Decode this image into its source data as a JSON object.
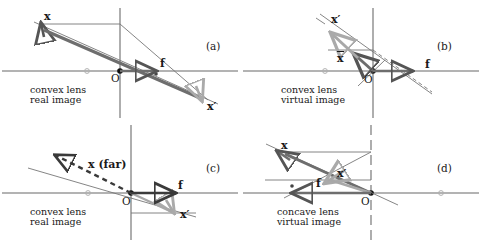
{
  "figure": {
    "panel_count": 4,
    "colors": {
      "object_vector": "#555555",
      "image_vector": "#a8a8a8",
      "axis": "#9a9a9a",
      "lens_plane": "#9a9a9a",
      "ray": "#4a4a4a",
      "text": "#1a1a1a",
      "focal_point": "#111111"
    }
  },
  "panels": [
    {
      "tag": "(a)",
      "caption_line1": "convex lens",
      "caption_line2": "real image",
      "origin_label": "O",
      "object_label": "x",
      "image_label": "x′",
      "focal_label": "f",
      "object_side": "left",
      "image_type": "real",
      "lens_type": "convex"
    },
    {
      "tag": "(b)",
      "caption_line1": "convex lens",
      "caption_line2": "virtual image",
      "origin_label": "O",
      "object_label": "x",
      "image_label": "x′",
      "focal_label": "f",
      "object_side": "left",
      "image_type": "virtual",
      "lens_type": "convex"
    },
    {
      "tag": "(c)",
      "caption_line1": "convex lens",
      "caption_line2": "real image",
      "origin_label": "O",
      "object_label": "x (far)",
      "image_label": "x′",
      "focal_label": "f",
      "object_side": "left",
      "image_type": "real",
      "lens_type": "convex"
    },
    {
      "tag": "(d)",
      "caption_line1": "concave lens",
      "caption_line2": "virtual image",
      "origin_label": "O",
      "object_label": "x",
      "image_label": "x′",
      "focal_label": "f",
      "object_side": "left",
      "image_type": "virtual",
      "lens_type": "concave"
    }
  ]
}
